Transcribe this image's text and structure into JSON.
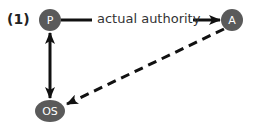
{
  "figure": {
    "number_label": "(1)",
    "colors": {
      "node_fill": "#5a5a5a",
      "node_text": "#ffffff",
      "edge": "#111111",
      "label_text": "#333333"
    },
    "nodes": [
      {
        "id": "P",
        "label": "P",
        "shape": "circle"
      },
      {
        "id": "A",
        "label": "A",
        "shape": "circle"
      },
      {
        "id": "OS",
        "label": "OS",
        "shape": "ellipse"
      }
    ],
    "edges": [
      {
        "from": "P",
        "to": "A",
        "style": "solid",
        "direction": "forward",
        "label": "actual authority"
      },
      {
        "from": "P",
        "to": "OS",
        "style": "solid",
        "direction": "both",
        "label": ""
      },
      {
        "from": "A",
        "to": "OS",
        "style": "dashed",
        "direction": "forward",
        "label": ""
      }
    ]
  }
}
